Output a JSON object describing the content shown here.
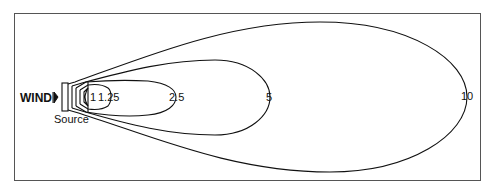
{
  "diagram": {
    "type": "plume-concentration-contours",
    "wind_label": "WIND",
    "source_label": "Source",
    "contours": [
      {
        "label": "1",
        "x_end": 100
      },
      {
        "label": "1.25",
        "x_end": 110
      },
      {
        "label": "2.5",
        "x_end": 176
      },
      {
        "label": "5",
        "x_end": 270
      },
      {
        "label": "10",
        "x_end": 467
      }
    ],
    "colors": {
      "line": "#111111",
      "frame": "#555555",
      "background": "#ffffff"
    }
  }
}
